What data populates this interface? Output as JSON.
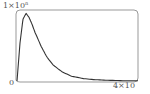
{
  "chart_data": {
    "type": "line",
    "title": "",
    "xlabel": "",
    "ylabel": "",
    "y_tick_top": "1×10",
    "y_tick_top_exp": "n",
    "y_tick_bottom": "0",
    "x_tick_right": "4×10",
    "xlim": [
      0,
      4
    ],
    "ylim": [
      0,
      1
    ],
    "grid": false,
    "legend": null,
    "series": [
      {
        "name": "distribution",
        "x": [
          0,
          0.1,
          0.2,
          0.3,
          0.4,
          0.5,
          0.6,
          0.8,
          1.0,
          1.2,
          1.5,
          1.8,
          2.2,
          2.6,
          3.0,
          3.5,
          4.0
        ],
        "values": [
          0,
          0.55,
          0.9,
          0.98,
          0.92,
          0.82,
          0.7,
          0.5,
          0.34,
          0.23,
          0.13,
          0.07,
          0.035,
          0.018,
          0.01,
          0.005,
          0.003
        ]
      }
    ],
    "colors": {
      "line": "#333333",
      "frame": "#888888",
      "text": "#555555"
    }
  }
}
